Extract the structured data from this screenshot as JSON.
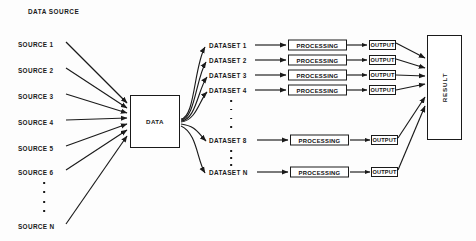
{
  "diagram": {
    "title": "DATA SOURCE",
    "background_color": "#fdfdfd",
    "stroke_color": "#1a1a1a",
    "type": "flow-diagram",
    "sources": [
      {
        "label": "SOURCE 1",
        "y": 44
      },
      {
        "label": "SOURCE 2",
        "y": 70
      },
      {
        "label": "SOURCE 3",
        "y": 96
      },
      {
        "label": "SOURCE 4",
        "y": 122
      },
      {
        "label": "SOURCE 5",
        "y": 148
      },
      {
        "label": "SOURCE 6",
        "y": 172
      },
      {
        "label": "SOURCE N",
        "y": 226
      }
    ],
    "source_ellipsis_dots": 4,
    "data_node": {
      "label": "DATA",
      "x": 130,
      "y": 95,
      "width": 50,
      "height": 53
    },
    "rows": [
      {
        "dataset": "DATASET 1",
        "processing": "PROCESSING",
        "output": "OUTPUT",
        "y": 45
      },
      {
        "dataset": "DATASET 2",
        "processing": "PROCESSING",
        "output": "OUTPUT",
        "y": 60
      },
      {
        "dataset": "DATASET 3",
        "processing": "PROCESSING",
        "output": "OUTPUT",
        "y": 75
      },
      {
        "dataset": "DATASET 4",
        "processing": "PROCESSING",
        "output": "OUTPUT",
        "y": 90
      },
      {
        "dataset": "DATASET 8",
        "processing": "PROCESSING",
        "output": "OUTPUT",
        "y": 140
      },
      {
        "dataset": "DATASET N",
        "processing": "PROCESSING",
        "output": "OUTPUT",
        "y": 172
      }
    ],
    "dataset_ellipsis_upper_dots": 4,
    "dataset_ellipsis_lower_dots": 3,
    "result_node": {
      "label": "RESULT",
      "x": 427,
      "y": 35,
      "width": 35,
      "height": 105
    }
  }
}
